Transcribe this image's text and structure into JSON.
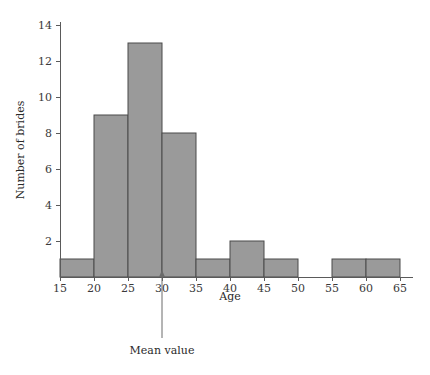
{
  "chart_data": {
    "type": "bar",
    "title": "",
    "xlabel": "Age",
    "ylabel": "Number of brides",
    "xlim": [
      15,
      65
    ],
    "ylim": [
      0,
      14.6
    ],
    "grid": false,
    "legend": null,
    "bin_width": 5,
    "bin_edges": [
      15,
      20,
      25,
      30,
      35,
      40,
      45,
      50,
      55,
      60,
      65
    ],
    "categories": [
      "15-20",
      "20-25",
      "25-30",
      "30-35",
      "35-40",
      "40-45",
      "45-50",
      "50-55",
      "55-60",
      "60-65"
    ],
    "values": [
      1,
      9,
      13,
      8,
      1,
      2,
      1,
      0,
      1,
      1
    ],
    "xticks": [
      15,
      20,
      25,
      30,
      35,
      40,
      45,
      50,
      55,
      60,
      65
    ],
    "xtick_labels": [
      "15",
      "20",
      "25",
      "30",
      "35",
      "40",
      "45",
      "50",
      "55",
      "60",
      "65"
    ],
    "yticks": [
      2,
      4,
      6,
      8,
      10,
      12,
      14
    ],
    "ytick_labels": [
      "2",
      "4",
      "6",
      "8",
      "10",
      "12",
      "14"
    ],
    "annotations": [
      {
        "label": "Mean value",
        "x": 30,
        "kind": "pointer-line"
      }
    ],
    "colors": {
      "bar_fill": "#9a9a9a",
      "bar_stroke": "#4a4a4a",
      "axis": "#5a5a5a",
      "text": "#2a2a2a",
      "background": "#ffffff"
    }
  }
}
